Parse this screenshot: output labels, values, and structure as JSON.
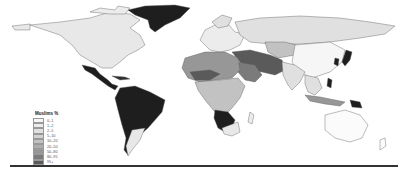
{
  "map": {
    "title": "Muslims %",
    "legend": [
      {
        "label": "0–1",
        "color": "#f6f6f6"
      },
      {
        "label": "1–2",
        "color": "#ececec"
      },
      {
        "label": "2–5",
        "color": "#e0e0e0"
      },
      {
        "label": "5–10",
        "color": "#d2d2d2"
      },
      {
        "label": "10–20",
        "color": "#c2c2c2"
      },
      {
        "label": "20–50",
        "color": "#aeaeae"
      },
      {
        "label": "50–80",
        "color": "#979797"
      },
      {
        "label": "80–95",
        "color": "#7b7b7b"
      },
      {
        "label": "95+",
        "color": "#5a5a5a"
      }
    ],
    "colors": {
      "dark": "#1e1e1e",
      "light": "#e8e8e8",
      "white": "#fbfbfb",
      "mid": "#9a9a9a",
      "midDark": "#6e6e6e",
      "border": "#444444",
      "rule": "#333333"
    }
  }
}
